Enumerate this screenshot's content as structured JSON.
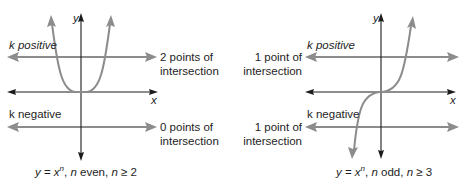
{
  "diagrams": [
    {
      "id": "even",
      "axis_labels": {
        "x": "x",
        "y": "y"
      },
      "upper_line": {
        "label": "k positive",
        "result_line1": "2 points of",
        "result_line2": "intersection"
      },
      "lower_line": {
        "label": "k negative",
        "result_line1": "0 points of",
        "result_line2": "intersection"
      },
      "caption": {
        "y": "y",
        "eq": " = ",
        "x": "x",
        "exp": "n",
        "sep1": ", ",
        "n1": "n",
        "parity": " even, ",
        "n2": "n",
        "cond": " ≥ 2"
      }
    },
    {
      "id": "odd",
      "axis_labels": {
        "x": "x",
        "y": "y"
      },
      "upper_line": {
        "label": "k positive",
        "result_line1": "1 point of",
        "result_line2": "intersection"
      },
      "lower_line": {
        "label": "k negative",
        "result_line1": "1 point of",
        "result_line2": "intersection"
      },
      "caption": {
        "y": "y",
        "eq": " = ",
        "x": "x",
        "exp": "n",
        "sep1": ", ",
        "n1": "n",
        "parity": " odd, ",
        "n2": "n",
        "cond": " ≥ 3"
      }
    }
  ],
  "colors": {
    "axes": "#1c1c1c",
    "curves_and_lines": "#8c8c8c",
    "text": "#1e1e1e"
  }
}
